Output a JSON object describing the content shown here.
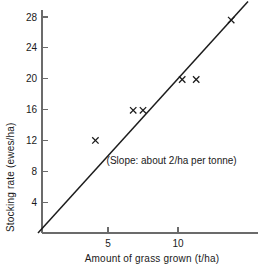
{
  "chart_data": {
    "type": "scatter",
    "title": "",
    "xlabel": "Amount of grass grown (t/ha)",
    "ylabel": "Stocking rate (ewes/ha)",
    "xlim": [
      0,
      15.6
    ],
    "ylim": [
      0,
      30.6
    ],
    "grid": false,
    "legend": "none",
    "x_ticks": [
      5,
      10
    ],
    "x_tick_labels": [
      "5",
      "10"
    ],
    "y_ticks": [
      4,
      8,
      12,
      16,
      20,
      24,
      28
    ],
    "y_tick_labels": [
      "4",
      "8",
      "12",
      "16",
      "20",
      "24",
      "28"
    ],
    "marker": "x",
    "points": [
      {
        "x": 4.1,
        "y": 12.0
      },
      {
        "x": 6.8,
        "y": 15.9
      },
      {
        "x": 7.5,
        "y": 15.9
      },
      {
        "x": 10.3,
        "y": 19.9
      },
      {
        "x": 11.3,
        "y": 19.9
      },
      {
        "x": 13.8,
        "y": 27.6
      }
    ],
    "series": [
      {
        "name": "observations",
        "x": [
          4.1,
          6.8,
          7.5,
          10.3,
          11.3,
          13.8
        ],
        "values": [
          12.0,
          15.9,
          15.9,
          19.9,
          19.9,
          27.6
        ]
      }
    ],
    "trend_line": {
      "type": "line",
      "slope": 2.0,
      "intercept": 0,
      "x_start": 0,
      "x_end": 15.0,
      "y_start": 0,
      "y_end": 30.0
    },
    "annotations": [
      {
        "text": "(Slope: about 2/ha per tonne)",
        "x": 4.9,
        "y": 9.0
      }
    ]
  },
  "colors": {
    "axis": "#6b6b6b",
    "line": "#1c1c1c",
    "marker": "#1a1a1a",
    "text": "#1a1a1a",
    "background": "#ffffff"
  }
}
